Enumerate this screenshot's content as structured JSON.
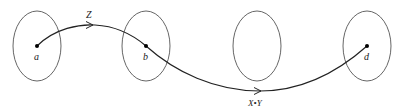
{
  "diagram": {
    "colors": {
      "ellipse_stroke": "#555555",
      "curve_stroke": "#222222",
      "point_fill": "#000000"
    },
    "regions": [
      {
        "id": "region-1",
        "cx": 37,
        "cy": 46,
        "rx": 24,
        "ry": 35
      },
      {
        "id": "region-2",
        "cx": 146,
        "cy": 46,
        "rx": 24,
        "ry": 35
      },
      {
        "id": "region-3",
        "cx": 257,
        "cy": 46,
        "rx": 24,
        "ry": 35
      },
      {
        "id": "region-4",
        "cx": 367,
        "cy": 46,
        "rx": 24,
        "ry": 35
      }
    ],
    "points": [
      {
        "label": "a",
        "x": 37,
        "y": 46
      },
      {
        "label": "b",
        "x": 146,
        "y": 46
      },
      {
        "label": "d",
        "x": 367,
        "y": 46
      }
    ],
    "arrows": [
      {
        "from": "a",
        "to": "b",
        "label": "Z"
      },
      {
        "from": "b",
        "to": "d",
        "label": "X•Y"
      }
    ]
  }
}
